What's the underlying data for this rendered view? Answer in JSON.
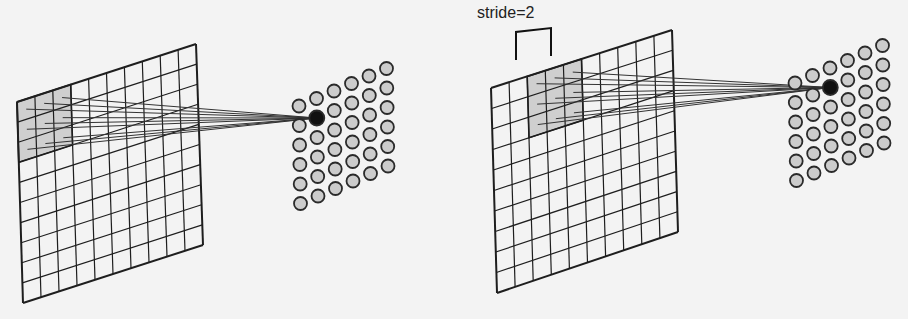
{
  "diagram": {
    "colors": {
      "background": "#f3f3f3",
      "grid_line": "#1e1e1e",
      "receptive_field_fill": "#cfcfcf",
      "node_fill": "#cccccc",
      "node_stroke": "#2a2a2a",
      "active_node_fill": "#111111"
    },
    "panels": [
      {
        "id": "stride-1",
        "input_grid": {
          "rows": 10,
          "cols": 10,
          "corners": {
            "tl": [
              17,
              102
            ],
            "tr": [
              196,
              44
            ],
            "br": [
              203,
              245
            ],
            "bl": [
              23,
              303
            ]
          },
          "receptive_field": {
            "row": 0,
            "col": 0,
            "size": 3
          }
        },
        "output_nodes": {
          "rows": 6,
          "cols": 6,
          "origin": [
            299,
            106
          ],
          "col_step": [
            17.5,
            -7.5
          ],
          "row_step": [
            0.3,
            19.5
          ],
          "active": {
            "row": 1,
            "col": 1
          }
        }
      },
      {
        "id": "stride-2",
        "label": "stride=2",
        "label_pos": [
          477,
          4
        ],
        "bracket": {
          "x1": 516,
          "x2": 551,
          "y_top": 32,
          "y_bottom": 60,
          "slope": -4
        },
        "input_grid": {
          "rows": 10,
          "cols": 10,
          "corners": {
            "tl": [
              491,
              88
            ],
            "tr": [
              672,
              30
            ],
            "br": [
              678,
              232
            ],
            "bl": [
              497,
              293
            ]
          },
          "receptive_field": {
            "row": 0,
            "col": 2,
            "size": 3
          }
        },
        "output_nodes": {
          "rows": 6,
          "cols": 6,
          "origin": [
            795,
            83
          ],
          "col_step": [
            17.5,
            -7.5
          ],
          "row_step": [
            0.3,
            19.5
          ],
          "active": {
            "row": 1,
            "col": 2
          }
        }
      }
    ]
  }
}
